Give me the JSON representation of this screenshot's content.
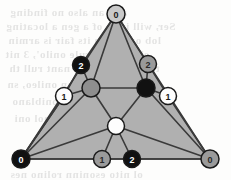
{
  "figure": {
    "width": 231,
    "height": 180,
    "background_color": "#fdfdfc",
    "face_fill_color": "#b0b0b0",
    "edge_color": "#3a3a3a",
    "node_stroke_color": "#1a1a1a"
  },
  "palette": {
    "black": "#111111",
    "gray": "#9a9a9a",
    "light_gray": "#c9c9c9",
    "white": "#fdfdfd",
    "mid_gray": "#8e8e8e",
    "label_on_dark": "#ffffff",
    "label_on_light": "#1a1a1a"
  },
  "nodes": [
    {
      "id": "top",
      "name": "vertex-top-apex",
      "x": 116,
      "y": 14,
      "r": 9,
      "fill": "#c9c9c9",
      "label": "0",
      "label_color": "#1a1a1a"
    },
    {
      "id": "bottom_left",
      "name": "vertex-bottom-left",
      "x": 21,
      "y": 159,
      "r": 9,
      "fill": "#111111",
      "label": "0",
      "label_color": "#ffffff"
    },
    {
      "id": "bottom_right",
      "name": "vertex-bottom-right",
      "x": 210,
      "y": 159,
      "r": 9,
      "fill": "#9a9a9a",
      "label": "0",
      "label_color": "#2a2a2a"
    },
    {
      "id": "left_2",
      "name": "edge-node-left-two",
      "x": 81,
      "y": 65,
      "r": 8.5,
      "fill": "#111111",
      "label": "2",
      "label_color": "#ffffff"
    },
    {
      "id": "right_2",
      "name": "edge-node-right-two",
      "x": 148,
      "y": 64,
      "r": 8.5,
      "fill": "#9a9a9a",
      "label": "2",
      "label_color": "#2a2a2a"
    },
    {
      "id": "left_1",
      "name": "edge-node-left-one",
      "x": 64,
      "y": 96,
      "r": 8.5,
      "fill": "#fdfdfd",
      "label": "1",
      "label_color": "#1a1a1a"
    },
    {
      "id": "right_1",
      "name": "edge-node-right-one",
      "x": 168,
      "y": 96,
      "r": 8.5,
      "fill": "#fdfdfd",
      "label": "1",
      "label_color": "#1a1a1a"
    },
    {
      "id": "bottom_1",
      "name": "edge-node-bottom-one",
      "x": 102,
      "y": 159,
      "r": 8.5,
      "fill": "#9a9a9a",
      "label": "1",
      "label_color": "#2a2a2a"
    },
    {
      "id": "bottom_2",
      "name": "edge-node-bottom-two",
      "x": 132,
      "y": 159,
      "r": 8.5,
      "fill": "#111111",
      "label": "2",
      "label_color": "#ffffff"
    },
    {
      "id": "inner_gray",
      "name": "interior-node-gray",
      "x": 91,
      "y": 88,
      "r": 9,
      "fill": "#8e8e8e",
      "label": "",
      "label_color": "#1a1a1a"
    },
    {
      "id": "inner_black",
      "name": "interior-node-black",
      "x": 146,
      "y": 88,
      "r": 9,
      "fill": "#111111",
      "label": "",
      "label_color": "#ffffff"
    },
    {
      "id": "inner_white",
      "name": "interior-node-white",
      "x": 116,
      "y": 126,
      "r": 8.5,
      "fill": "#fdfdfd",
      "label": "",
      "label_color": "#1a1a1a"
    }
  ],
  "edges": [
    {
      "from": "top",
      "to": "left_2",
      "name": "edge-top-left2"
    },
    {
      "from": "left_2",
      "to": "left_1",
      "name": "edge-left2-left1"
    },
    {
      "from": "left_1",
      "to": "bottom_left",
      "name": "edge-left1-bottomleft"
    },
    {
      "from": "top",
      "to": "right_2",
      "name": "edge-top-right2"
    },
    {
      "from": "right_2",
      "to": "right_1",
      "name": "edge-right2-right1"
    },
    {
      "from": "right_1",
      "to": "bottom_right",
      "name": "edge-right1-bottomright"
    },
    {
      "from": "bottom_left",
      "to": "bottom_1",
      "name": "edge-bottomleft-bottom1"
    },
    {
      "from": "bottom_1",
      "to": "bottom_2",
      "name": "edge-bottom1-bottom2"
    },
    {
      "from": "bottom_2",
      "to": "bottom_right",
      "name": "edge-bottom2-bottomright"
    },
    {
      "from": "top",
      "to": "inner_gray",
      "name": "edge-top-innergray"
    },
    {
      "from": "top",
      "to": "inner_black",
      "name": "edge-top-innerblack"
    },
    {
      "from": "left_2",
      "to": "inner_gray",
      "name": "edge-left2-innergray"
    },
    {
      "from": "left_1",
      "to": "inner_gray",
      "name": "edge-left1-innergray"
    },
    {
      "from": "right_2",
      "to": "inner_black",
      "name": "edge-right2-innerblack"
    },
    {
      "from": "right_1",
      "to": "inner_black",
      "name": "edge-right1-innerblack"
    },
    {
      "from": "inner_gray",
      "to": "inner_black",
      "name": "edge-innergray-innerblack"
    },
    {
      "from": "inner_gray",
      "to": "inner_white",
      "name": "edge-innergray-innerwhite"
    },
    {
      "from": "inner_black",
      "to": "inner_white",
      "name": "edge-innerblack-innerwhite"
    },
    {
      "from": "inner_white",
      "to": "bottom_left",
      "name": "edge-innerwhite-bottomleft"
    },
    {
      "from": "inner_white",
      "to": "bottom_1",
      "name": "edge-innerwhite-bottom1"
    },
    {
      "from": "inner_white",
      "to": "bottom_2",
      "name": "edge-innerwhite-bottomright-a"
    },
    {
      "from": "inner_white",
      "to": "bottom_right",
      "name": "edge-innerwhite-bottomright"
    },
    {
      "from": "inner_gray",
      "to": "bottom_left",
      "name": "edge-innergray-bottomleft"
    },
    {
      "from": "inner_black",
      "to": "bottom_right",
      "name": "edge-innerblack-bottomright"
    },
    {
      "from": "left_1",
      "to": "bottom_left",
      "name": "edge-left1-bottomleft-dup"
    }
  ],
  "faces": [
    {
      "name": "face-outer-triangle",
      "points": "116,14 21,159 210,159"
    }
  ],
  "bleed_text": {
    "note": "faint mirrored show-through text from reverse of scanned page",
    "lines": [
      {
        "text": "and an also no finding",
        "x": 10,
        "y": 6,
        "size": 11
      },
      {
        "text": "Ser, will it be of a gen a locating",
        "x": 6,
        "y": 20,
        "size": 11
      },
      {
        "text": "lob or 2 noin its fair is armin",
        "x": 8,
        "y": 34,
        "size": 11
      },
      {
        "text": "ebase with rule onilo', 3 nit",
        "x": 5,
        "y": 48,
        "size": 11
      },
      {
        "text": "the all singnon e nant rull th",
        "x": 9,
        "y": 62,
        "size": 11
      },
      {
        "text": "ninolesno nan onileo, sn",
        "x": 7,
        "y": 78,
        "size": 11
      },
      {
        "text": "ot, it arniso oniblano",
        "x": 12,
        "y": 95,
        "size": 11
      },
      {
        "text": "goiblom sninol oni",
        "x": 14,
        "y": 112,
        "size": 11
      },
      {
        "text": "ol nito esoninn rolino nes",
        "x": 10,
        "y": 168,
        "size": 11
      }
    ]
  }
}
